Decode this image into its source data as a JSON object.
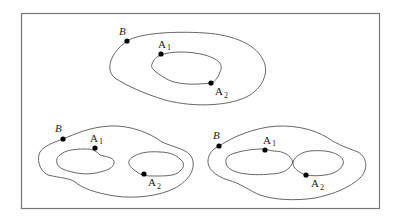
{
  "figure": {
    "panels": [
      {
        "id": "top",
        "description": "Annulus: outer boundary B with a single inner hole whose boundary contains A1 and A2",
        "labels": {
          "B": "B",
          "A1_main": "A",
          "A1_sub": "1",
          "A2_main": "A",
          "A2_sub": "2"
        }
      },
      {
        "id": "bottom-left",
        "description": "Outer boundary B with two disjoint inner holes; A1 on left hole, A2 on right hole",
        "labels": {
          "B": "B",
          "A1_main": "A",
          "A1_sub": "1",
          "A2_main": "A",
          "A2_sub": "2"
        }
      },
      {
        "id": "bottom-right",
        "description": "Outer boundary B with two inner holes touching at a point; A1 on left hole, A2 on right hole",
        "labels": {
          "B": "B",
          "A1_main": "A",
          "A1_sub": "1",
          "A2_main": "A",
          "A2_sub": "2"
        }
      }
    ],
    "colors": {
      "stroke": "#555555",
      "frame": "#777777",
      "point": "#000000",
      "background": "#ffffff"
    }
  }
}
